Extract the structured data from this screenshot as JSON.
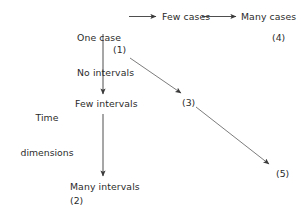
{
  "diagram": {
    "background_color": "#ffffff",
    "text_color": "#2b2b2b",
    "line_color": "#3a3a3a",
    "axis_label": {
      "line1": "Time",
      "line2": "dimensions"
    },
    "nodes": [
      {
        "id": "one-case",
        "line1": "One case",
        "line2": "No intervals"
      },
      {
        "id": "few-cases",
        "label": "Few cases"
      },
      {
        "id": "many-cases",
        "label": "Many cases"
      },
      {
        "id": "few-intervals",
        "label": "Few intervals"
      },
      {
        "id": "many-intervals",
        "label": "Many intervals"
      }
    ],
    "refs": [
      {
        "id": "ref-1",
        "label": "(1)"
      },
      {
        "id": "ref-2",
        "label": "(2)"
      },
      {
        "id": "ref-3",
        "label": "(3)"
      },
      {
        "id": "ref-4",
        "label": "(4)"
      },
      {
        "id": "ref-5",
        "label": "(5)"
      }
    ],
    "arrows": [
      {
        "id": "one-case-to-few-cases",
        "from": "one-case",
        "to": "few-cases",
        "direction": "right"
      },
      {
        "id": "few-cases-to-many-cases",
        "from": "few-cases",
        "to": "many-cases",
        "direction": "right"
      },
      {
        "id": "one-case-to-few-intervals",
        "from": "one-case",
        "to": "few-intervals",
        "direction": "down"
      },
      {
        "id": "few-intervals-to-many-intervals",
        "from": "few-intervals",
        "to": "many-intervals",
        "direction": "down"
      },
      {
        "id": "one-case-to-ref-3",
        "from": "one-case",
        "to": "ref-3",
        "direction": "diagonal-down-right"
      },
      {
        "id": "ref-3-to-ref-5",
        "from": "ref-3",
        "to": "ref-5",
        "direction": "diagonal-down-right"
      }
    ]
  }
}
